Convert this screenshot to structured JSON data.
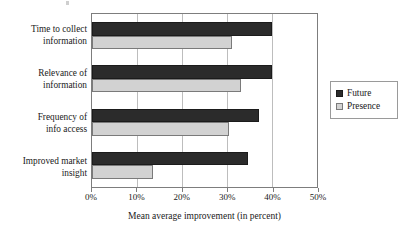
{
  "chart_data": {
    "type": "bar",
    "orientation": "horizontal",
    "title": "",
    "subtitle": "",
    "xlabel": "Mean average improvement (in percent)",
    "ylabel": "",
    "xlim": [
      0,
      50
    ],
    "xticks": [
      "0%",
      "10%",
      "20%",
      "30%",
      "40%",
      "50%"
    ],
    "xtick_values": [
      0,
      10,
      20,
      30,
      40,
      50
    ],
    "grid": true,
    "grid_axis": "x",
    "legend_position": "right",
    "categories": [
      "Time to collect information",
      "Relevance of information",
      "Frequency of info access",
      "Improved market insight"
    ],
    "category_lines": [
      [
        "Time to collect",
        "information"
      ],
      [
        "Relevance of",
        "information"
      ],
      [
        "Frequency of",
        "info access"
      ],
      [
        "Improved market",
        "insight"
      ]
    ],
    "series": [
      {
        "name": "Future",
        "color": "#2b2b2b",
        "values": [
          40,
          40,
          37,
          34.7
        ]
      },
      {
        "name": "Presence",
        "color": "#d2d2d2",
        "values": [
          31,
          33,
          30.5,
          13.5
        ]
      }
    ]
  },
  "legend": {
    "items": [
      {
        "label": "Future",
        "swatch": "dark-square-swatch"
      },
      {
        "label": "Presence",
        "swatch": "light-square-swatch"
      }
    ]
  }
}
